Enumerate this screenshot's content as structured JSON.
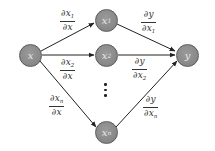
{
  "diagram": {
    "type": "computational-graph",
    "colors": {
      "node_fill": "#8a8a8a",
      "node_border": "#5a5a5a",
      "node_text": "#e8e8e8",
      "edge": "#222222",
      "label_text": "#333333"
    },
    "nodes": [
      {
        "id": "x",
        "var": "x",
        "sub": ""
      },
      {
        "id": "x1",
        "var": "x",
        "sub": "1"
      },
      {
        "id": "x2",
        "var": "x",
        "sub": "2"
      },
      {
        "id": "xn",
        "var": "x",
        "sub": "n"
      },
      {
        "id": "y",
        "var": "y",
        "sub": ""
      }
    ],
    "edges": [
      {
        "from": "x",
        "to": "x1",
        "num": "∂x",
        "num_sub": "1",
        "den": "∂x",
        "den_sub": ""
      },
      {
        "from": "x",
        "to": "x2",
        "num": "∂x",
        "num_sub": "2",
        "den": "∂x",
        "den_sub": ""
      },
      {
        "from": "x",
        "to": "xn",
        "num": "∂x",
        "num_sub": "n",
        "den": "∂x",
        "den_sub": ""
      },
      {
        "from": "x1",
        "to": "y",
        "num": "∂y",
        "num_sub": "",
        "den": "∂x",
        "den_sub": "1"
      },
      {
        "from": "x2",
        "to": "y",
        "num": "∂y",
        "num_sub": "",
        "den": "∂x",
        "den_sub": "2"
      },
      {
        "from": "xn",
        "to": "y",
        "num": "∂y",
        "num_sub": "",
        "den": "∂x",
        "den_sub": "n"
      }
    ],
    "ellipsis": "vertical-dots"
  }
}
